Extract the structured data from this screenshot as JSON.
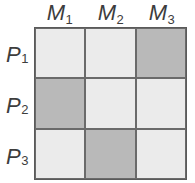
{
  "columns": [
    {
      "symbol": "M",
      "index": "1"
    },
    {
      "symbol": "M",
      "index": "2"
    },
    {
      "symbol": "M",
      "index": "3"
    }
  ],
  "rows": [
    {
      "symbol": "P",
      "index": "1"
    },
    {
      "symbol": "P",
      "index": "2"
    },
    {
      "symbol": "P",
      "index": "3"
    }
  ],
  "matrix": [
    [
      "light",
      "light",
      "dark"
    ],
    [
      "dark",
      "light",
      "light"
    ],
    [
      "light",
      "dark",
      "light"
    ]
  ],
  "colors": {
    "light_cell": "#ebebeb",
    "dark_cell": "#b9b9b9",
    "grid_line": "#5a5a5a",
    "label_text": "#3d3d3d"
  }
}
